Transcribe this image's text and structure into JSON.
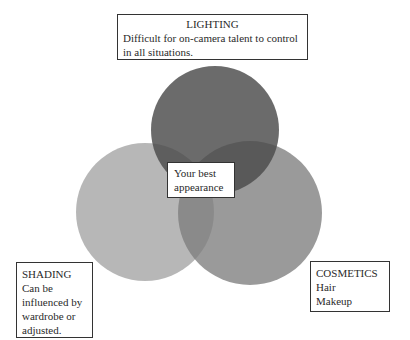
{
  "diagram": {
    "type": "venn",
    "circles": [
      {
        "id": "lighting",
        "cx": 215,
        "cy": 130,
        "r": 64,
        "color": "#5e5e5e"
      },
      {
        "id": "shading",
        "cx": 145,
        "cy": 212,
        "r": 69,
        "color": "#b0b0b0"
      },
      {
        "id": "cosmetics",
        "cx": 250,
        "cy": 213,
        "r": 72,
        "color": "#8c8c8c"
      }
    ]
  },
  "lighting": {
    "title": "LIGHTING",
    "lines": [
      "Difficult for on-camera talent to control",
      "in all situations."
    ]
  },
  "center": {
    "lines": [
      "Your best",
      "appearance"
    ]
  },
  "shading": {
    "title": "SHADING",
    "lines": [
      "Can be",
      "influenced by",
      "wardrobe or",
      "adjusted."
    ]
  },
  "cosmetics": {
    "title": "COSMETICS",
    "lines": [
      "Hair",
      "Makeup"
    ]
  }
}
